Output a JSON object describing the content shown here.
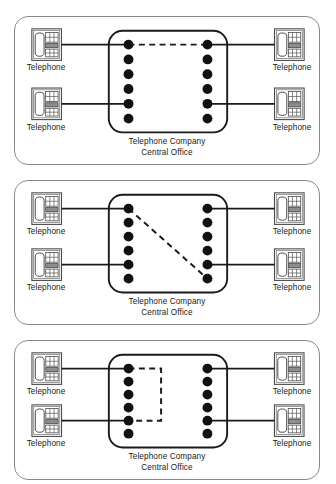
{
  "figure": {
    "panel_count": 3,
    "colors": {
      "panel_border": "#8a8a8a",
      "co_box_border": "#1a1a1a",
      "dot": "#111111",
      "line": "#1a1a1a",
      "dash": "#1a1a1a",
      "background": "#ffffff",
      "phone_body": "#555555"
    }
  },
  "labels": {
    "telephone": "Telephone",
    "central_office_line1": "Telephone Company",
    "central_office_line2": "Central Office"
  },
  "icons": {
    "telephone": "telephone-icon",
    "switch_contact": "contact-dot-icon"
  },
  "panels": [
    {
      "id": "panel-connected",
      "name": "panel-1",
      "state": "connected",
      "contacts_left": 6,
      "contacts_right": 6,
      "phones_left": 2,
      "phones_right": 2,
      "connection": {
        "type": "horizontal-dashed",
        "from_contact": 1,
        "to_contact": 1
      },
      "trunk_rows": [
        1,
        5
      ],
      "co_label_line1": "Telephone Company",
      "co_label_line2": "Central Office",
      "phone_labels": [
        "Telephone",
        "Telephone",
        "Telephone",
        "Telephone"
      ]
    },
    {
      "id": "panel-cross-connected",
      "name": "panel-2",
      "state": "cross-connected",
      "contacts_left": 6,
      "contacts_right": 6,
      "phones_left": 2,
      "phones_right": 2,
      "connection": {
        "type": "diagonal-dashed",
        "from_contact": 1,
        "to_contact": 6
      },
      "trunk_rows": [
        1,
        5
      ],
      "co_label_line1": "Telephone Company",
      "co_label_line2": "Central Office",
      "phone_labels": [
        "Telephone",
        "Telephone",
        "Telephone",
        "Telephone"
      ]
    },
    {
      "id": "panel-open",
      "name": "panel-3",
      "state": "open-loop",
      "contacts_left": 6,
      "contacts_right": 6,
      "phones_left": 2,
      "phones_right": 2,
      "connection": {
        "type": "u-bracket-dashed",
        "from_contact": 1,
        "to_contact": 5
      },
      "trunk_rows": [
        1,
        5
      ],
      "co_label_line1": "Telephone Company",
      "co_label_line2": "Central Office",
      "phone_labels": [
        "Telephone",
        "Telephone",
        "Telephone",
        "Telephone"
      ]
    }
  ],
  "geometry": {
    "co_box": {
      "x": 108,
      "y": 30,
      "w": 120,
      "h": 100,
      "radius": 14
    },
    "left_dot_x": 128,
    "right_dot_x": 208,
    "dot_r": 5.0,
    "dot_top_y": 46,
    "dot_gap": 14.4,
    "phone_left_x": 30,
    "phone_right_x": 276,
    "phone_w": 30,
    "phone_h": 32
  }
}
